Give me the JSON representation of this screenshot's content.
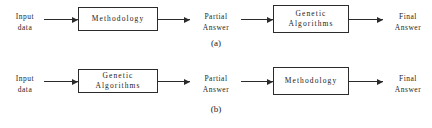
{
  "figure": {
    "rows": [
      {
        "id": "a",
        "caption": "(a)",
        "start_label": {
          "line1": "Input",
          "line2": "data"
        },
        "box1": {
          "line1": "Methodology",
          "line2": ""
        },
        "middle_label": {
          "line1": "Partial",
          "line2": "Answer"
        },
        "box2": {
          "line1": "Genetic",
          "line2": "Algorithms"
        },
        "end_label": {
          "line1": "Final",
          "line2": "Answer"
        }
      },
      {
        "id": "b",
        "caption": "(b)",
        "start_label": {
          "line1": "Input",
          "line2": "data"
        },
        "box1": {
          "line1": "Genetic",
          "line2": "Algorithms"
        },
        "middle_label": {
          "line1": "Partial",
          "line2": "Answer"
        },
        "box2": {
          "line1": "Methodology",
          "line2": ""
        },
        "end_label": {
          "line1": "Final",
          "line2": "Answer"
        }
      }
    ],
    "colors": {
      "background": "#ffffff",
      "stroke": "#2b2b2b",
      "text": "#1a1a1a"
    }
  }
}
